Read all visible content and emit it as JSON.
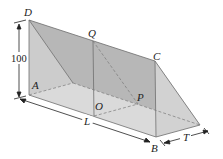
{
  "figure": {
    "type": "triangular prism (trough) diagram",
    "labels": {
      "D": "D",
      "Q": "Q",
      "C": "C",
      "A": "A",
      "O": "O",
      "P": "P",
      "L": "L",
      "B": "B",
      "T": "T"
    },
    "dimensions": {
      "height": "100",
      "length": "L",
      "width": "T"
    },
    "colors": {
      "top_face": "#a9a9a9",
      "left_face": "#d0d0d0",
      "right_face": "#cfcfcf",
      "bottom_face": "#ececec",
      "plane_section": "#bdbdbd",
      "edge": "#6e6e6e",
      "dimension": "#222222"
    }
  }
}
